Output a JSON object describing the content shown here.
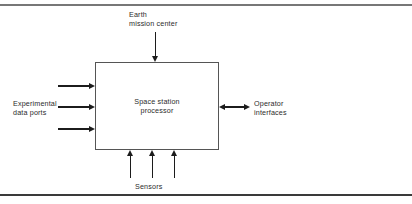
{
  "figure": {
    "process": {
      "label": "Space station\nprocessor",
      "box": {
        "x": 95,
        "y": 62,
        "width": 124,
        "height": 88
      }
    },
    "labels": {
      "earth_mission_center": "Earth\nmission center",
      "experimental_data_ports": "Experimental\ndata ports",
      "operator_interfaces": "Operator\ninterfaces",
      "sensors": "Sensors"
    },
    "flows": [
      {
        "name": "earth-mission-center-flow",
        "direction": "down",
        "count": 1
      },
      {
        "name": "experimental-data-ports-flow",
        "direction": "right",
        "count": 3
      },
      {
        "name": "operator-interfaces-flow",
        "direction": "bidirectional",
        "count": 1
      },
      {
        "name": "sensors-flow",
        "direction": "up",
        "count": 3
      }
    ],
    "colors": {
      "line": "#1c1c1c",
      "box_border": "#555555",
      "text": "#2b2b2b",
      "frame_top": "#777777",
      "frame_bottom": "#3a3a3a",
      "background": "#ffffff"
    }
  }
}
